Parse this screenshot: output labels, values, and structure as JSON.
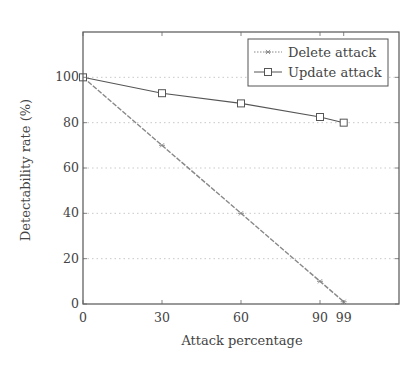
{
  "chart_data": {
    "type": "line",
    "title": "",
    "xlabel": "Attack percentage",
    "ylabel": "Detectability rate (%)",
    "x": [
      0,
      30,
      60,
      90,
      99
    ],
    "xticks": [
      0,
      30,
      60,
      90,
      99
    ],
    "yticks": [
      0,
      20,
      40,
      60,
      80,
      100
    ],
    "xlim": [
      0,
      120
    ],
    "ylim": [
      0,
      120
    ],
    "grid": "horizontal dotted",
    "legend_position": "top-right",
    "series": [
      {
        "name": "Delete attack",
        "values": [
          100,
          70,
          40,
          10,
          1
        ],
        "marker": "star",
        "line": "dotted",
        "color": "#888888"
      },
      {
        "name": "Update attack",
        "values": [
          100,
          93,
          88.5,
          82.5,
          80
        ],
        "marker": "square",
        "line": "solid",
        "color": "#555555"
      }
    ]
  }
}
